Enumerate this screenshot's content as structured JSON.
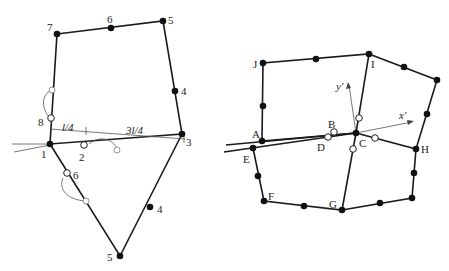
{
  "left_diagram": {
    "node_labels": [
      "1",
      "2",
      "3",
      "4",
      "5",
      "6",
      "7",
      "8"
    ],
    "lower_node_labels": [
      "6",
      "4",
      "5"
    ],
    "dimension_labels": [
      "l/4",
      "3l/4"
    ]
  },
  "right_diagram": {
    "node_labels": [
      "A",
      "B",
      "C",
      "D",
      "E",
      "F",
      "G",
      "H",
      "I",
      "J"
    ],
    "axis_labels": {
      "x": "x′",
      "y": "y′"
    }
  }
}
